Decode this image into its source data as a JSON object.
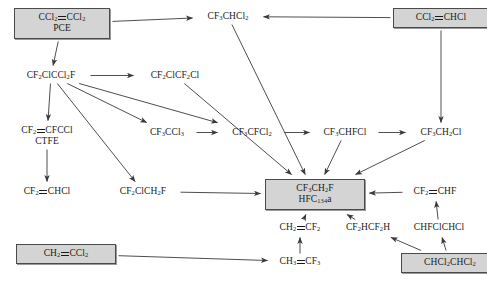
{
  "diagram": {
    "type": "chemical-reaction-flow-diagram",
    "width": 487,
    "height": 286,
    "box_fill": "#d4d4d4",
    "box_border": "#4a4a4a",
    "line_color": "#3a3a3a",
    "nodes": [
      {
        "id": "pce",
        "line1": "CCl2=CCl2",
        "line2": "PCE",
        "boxed": true,
        "x": 14,
        "y": 8,
        "w": 80
      },
      {
        "id": "cf3chcl2",
        "line1": "CF3CHCl2",
        "line2": "",
        "boxed": false,
        "x": 197,
        "y": 11,
        "w": 62
      },
      {
        "id": "ccl2chcl",
        "line1": "CCl2=CHCl",
        "line2": "",
        "boxed": true,
        "x": 393,
        "y": 8,
        "w": 80
      },
      {
        "id": "cf2clccl2f",
        "line1": "CF2ClCCl2F",
        "line2": "",
        "boxed": false,
        "x": 14,
        "y": 70,
        "w": 74
      },
      {
        "id": "cf2clcf2cl",
        "line1": "CF2ClCF2Cl",
        "line2": "",
        "boxed": false,
        "x": 138,
        "y": 70,
        "w": 74
      },
      {
        "id": "ctfe",
        "line1": "CF2=CFCCl",
        "line2": "CTFE",
        "boxed": false,
        "x": 12,
        "y": 125,
        "w": 70
      },
      {
        "id": "cf3ccl3",
        "line1": "CF3CCl3",
        "line2": "",
        "boxed": false,
        "x": 140,
        "y": 127,
        "w": 54
      },
      {
        "id": "cf3cfcl2",
        "line1": "CF3CFCl2",
        "line2": "",
        "boxed": false,
        "x": 222,
        "y": 127,
        "w": 60
      },
      {
        "id": "cf3chfcl",
        "line1": "CF3CHFCl",
        "line2": "",
        "boxed": false,
        "x": 314,
        "y": 127,
        "w": 62
      },
      {
        "id": "cf3ch2cl",
        "line1": "CF3CH2Cl",
        "line2": "",
        "boxed": false,
        "x": 410,
        "y": 127,
        "w": 62
      },
      {
        "id": "cf2chcl",
        "line1": "CF2=CHCl",
        "line2": "",
        "boxed": false,
        "x": 16,
        "y": 186,
        "w": 62
      },
      {
        "id": "cf2clch2f",
        "line1": "CF2ClCH2F",
        "line2": "",
        "boxed": false,
        "x": 108,
        "y": 186,
        "w": 70
      },
      {
        "id": "hfc134a",
        "line1": "CF3CH2F",
        "line2": "HFC134a",
        "boxed": true,
        "x": 265,
        "y": 179,
        "w": 84
      },
      {
        "id": "cf2chf",
        "line1": "CF2=CHF",
        "line2": "",
        "boxed": false,
        "x": 405,
        "y": 186,
        "w": 60
      },
      {
        "id": "ch2cf2",
        "line1": "CH2=CF2",
        "line2": "",
        "boxed": false,
        "x": 270,
        "y": 222,
        "w": 60
      },
      {
        "id": "cf2hcf2h",
        "line1": "CF2HCF2H",
        "line2": "",
        "boxed": false,
        "x": 337,
        "y": 222,
        "w": 62
      },
      {
        "id": "chfclchcl",
        "line1": "CHFClCHCl",
        "line2": "",
        "boxed": false,
        "x": 404,
        "y": 222,
        "w": 70
      },
      {
        "id": "ch2ccl2",
        "line1": "CH2=CCl2",
        "line2": "",
        "boxed": true,
        "x": 16,
        "y": 244,
        "w": 84
      },
      {
        "id": "ch3cf3",
        "line1": "CH3=CF3",
        "line2": "",
        "boxed": false,
        "x": 272,
        "y": 256,
        "w": 56
      },
      {
        "id": "chcl2chcl2",
        "line1": "CHCl2CHCl2",
        "line2": "",
        "boxed": true,
        "x": 401,
        "y": 253,
        "w": 82
      }
    ],
    "edges": [
      {
        "from": "pce",
        "to": "cf3chcl2"
      },
      {
        "from": "pce",
        "to": "cf2clccl2f"
      },
      {
        "from": "ccl2chcl",
        "to": "cf3chcl2"
      },
      {
        "from": "ccl2chcl",
        "to": "cf3ch2cl"
      },
      {
        "from": "cf2clccl2f",
        "to": "cf2clcf2cl"
      },
      {
        "from": "cf2clccl2f",
        "to": "ctfe"
      },
      {
        "from": "cf2clccl2f",
        "to": "cf3ccl3"
      },
      {
        "from": "cf2clccl2f",
        "to": "cf3cfcl2"
      },
      {
        "from": "cf2clccl2f",
        "to": "cf2clch2f"
      },
      {
        "from": "cf2clcf2cl",
        "to": "hfc134a"
      },
      {
        "from": "cf3chcl2",
        "to": "hfc134a"
      },
      {
        "from": "ctfe",
        "to": "cf2chcl"
      },
      {
        "from": "cf3ccl3",
        "to": "cf3cfcl2"
      },
      {
        "from": "cf3cfcl2",
        "to": "cf3chfcl"
      },
      {
        "from": "cf3chfcl",
        "to": "cf3ch2cl"
      },
      {
        "from": "cf3chfcl",
        "to": "hfc134a"
      },
      {
        "from": "cf3ch2cl",
        "to": "hfc134a"
      },
      {
        "from": "cf2clch2f",
        "to": "hfc134a"
      },
      {
        "from": "cf2chf",
        "to": "hfc134a"
      },
      {
        "from": "ch2cf2",
        "to": "hfc134a"
      },
      {
        "from": "cf2hcf2h",
        "to": "hfc134a"
      },
      {
        "from": "chfclchcl",
        "to": "cf2chf"
      },
      {
        "from": "chcl2chcl2",
        "to": "chfclchcl"
      },
      {
        "from": "chcl2chcl2",
        "to": "cf2hcf2h"
      },
      {
        "from": "ch2ccl2",
        "to": "ch3cf3"
      },
      {
        "from": "ch3cf3",
        "to": "ch2cf2"
      }
    ]
  }
}
